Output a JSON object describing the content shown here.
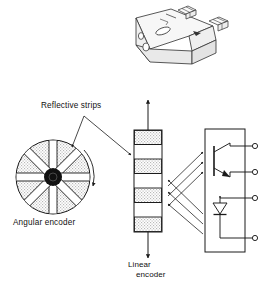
{
  "figure": {
    "background_color": "#ffffff",
    "line_color": "#1a1a1a",
    "hatch_fill_color": "#d8d8d8",
    "hub_color": "#111111",
    "housing_fill_color": "#f2f2f2"
  },
  "labels": {
    "reflective_strips": "Reflective strips",
    "angular_encoder": "Angular encoder",
    "linear_encoder_line1": "Linear",
    "linear_encoder_line2": "encoder"
  },
  "components": {
    "sensor_housing": {
      "name": "sensor-housing-3d",
      "description": "isometric reflective sensor housing with two lens windows and terminal pins"
    },
    "angular_encoder_disc": {
      "name": "angular-encoder-disc",
      "center_x": 53,
      "center_y": 177,
      "radius": 37,
      "strip_count": 8,
      "strip_angles_deg": [
        0,
        45,
        90,
        135,
        180,
        225,
        270,
        315
      ],
      "hub_radius": 9,
      "rotation_arrow": "clockwise"
    },
    "linear_encoder_strip": {
      "name": "linear-encoder-strip",
      "x": 134,
      "y": 130,
      "width": 28,
      "height": 102,
      "band_count": 7,
      "arrow_up": true,
      "arrow_down": true
    },
    "detector_package": {
      "name": "detector-package",
      "x": 205,
      "y": 129,
      "width": 40,
      "height": 123,
      "terminal_count": 4,
      "terminals_y": [
        146,
        172,
        198,
        238
      ],
      "parts": [
        "phototransistor",
        "led-emitter"
      ]
    },
    "light_beams": {
      "name": "light-beam-arrows",
      "incident_count": 3,
      "reflected_count": 3
    }
  }
}
